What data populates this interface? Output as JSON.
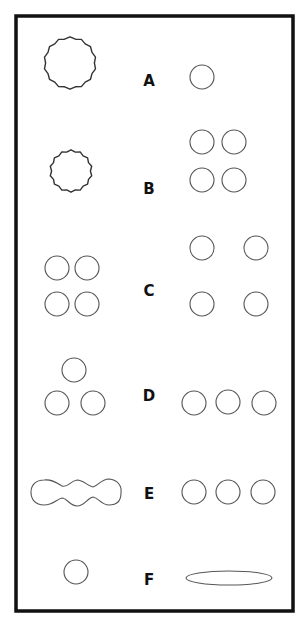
{
  "figure": {
    "frame": {
      "x": 16,
      "y": 16,
      "width": 277,
      "height": 595,
      "stroke": "#111111",
      "stroke_width": 3.5
    },
    "shape_stroke": "#555555",
    "label_color": "#111111",
    "rows": [
      {
        "label": "A",
        "label_x": 149,
        "label_y": 86,
        "left": [
          {
            "type": "circle",
            "cx": 70,
            "cy": 63,
            "r": 25,
            "stroke": "#333333",
            "wobbly": true
          }
        ],
        "right": [
          {
            "type": "circle",
            "cx": 202,
            "cy": 77,
            "r": 12
          }
        ]
      },
      {
        "label": "B",
        "label_x": 149,
        "label_y": 194,
        "left": [
          {
            "type": "circle",
            "cx": 71,
            "cy": 171,
            "r": 20,
            "stroke": "#333333",
            "wobbly": true
          }
        ],
        "right": [
          {
            "type": "circle",
            "cx": 202,
            "cy": 142,
            "r": 12
          },
          {
            "type": "circle",
            "cx": 234,
            "cy": 142,
            "r": 12
          },
          {
            "type": "circle",
            "cx": 202,
            "cy": 180,
            "r": 12
          },
          {
            "type": "circle",
            "cx": 234,
            "cy": 180,
            "r": 12
          }
        ]
      },
      {
        "label": "C",
        "label_x": 149,
        "label_y": 296,
        "left": [
          {
            "type": "circle",
            "cx": 57,
            "cy": 268,
            "r": 12
          },
          {
            "type": "circle",
            "cx": 87,
            "cy": 268,
            "r": 12
          },
          {
            "type": "circle",
            "cx": 57,
            "cy": 304,
            "r": 12
          },
          {
            "type": "circle",
            "cx": 87,
            "cy": 304,
            "r": 12
          }
        ],
        "right": [
          {
            "type": "circle",
            "cx": 202,
            "cy": 248,
            "r": 12
          },
          {
            "type": "circle",
            "cx": 256,
            "cy": 248,
            "r": 12
          },
          {
            "type": "circle",
            "cx": 202,
            "cy": 304,
            "r": 12
          },
          {
            "type": "circle",
            "cx": 256,
            "cy": 304,
            "r": 12
          }
        ]
      },
      {
        "label": "D",
        "label_x": 149,
        "label_y": 401,
        "left": [
          {
            "type": "circle",
            "cx": 74,
            "cy": 370,
            "r": 12
          },
          {
            "type": "circle",
            "cx": 57,
            "cy": 403,
            "r": 12
          },
          {
            "type": "circle",
            "cx": 93,
            "cy": 403,
            "r": 12
          }
        ],
        "right": [
          {
            "type": "circle",
            "cx": 194,
            "cy": 403,
            "r": 12
          },
          {
            "type": "circle",
            "cx": 228,
            "cy": 402,
            "r": 12
          },
          {
            "type": "circle",
            "cx": 264,
            "cy": 403,
            "r": 12
          }
        ]
      },
      {
        "label": "E",
        "label_x": 149,
        "label_y": 499,
        "left": [
          {
            "type": "chain",
            "path": "M 44 480 C 52 479, 57 483, 62 486 C 68 488, 70 481, 77 480 C 84 480, 87 486, 93 487 C 98 486, 101 479, 109 479 C 118 480, 122 486, 121 493 C 121 501, 117 505, 109 505 C 101 505, 99 498, 93 497 C 87 498, 85 506, 77 506 C 70 506, 67 498, 62 498 C 57 499, 53 505, 44 505 C 35 505, 31 499, 31 492 C 31 485, 36 480, 44 480 Z"
          }
        ],
        "right": [
          {
            "type": "circle",
            "cx": 194,
            "cy": 492,
            "r": 12
          },
          {
            "type": "circle",
            "cx": 228,
            "cy": 492,
            "r": 12
          },
          {
            "type": "circle",
            "cx": 263,
            "cy": 492,
            "r": 12
          }
        ]
      },
      {
        "label": "F",
        "label_x": 149,
        "label_y": 585,
        "left": [
          {
            "type": "circle",
            "cx": 76,
            "cy": 572,
            "r": 12
          }
        ],
        "right": [
          {
            "type": "ellipse",
            "cx": 229,
            "cy": 578,
            "rx": 43,
            "ry": 7
          }
        ]
      }
    ]
  }
}
